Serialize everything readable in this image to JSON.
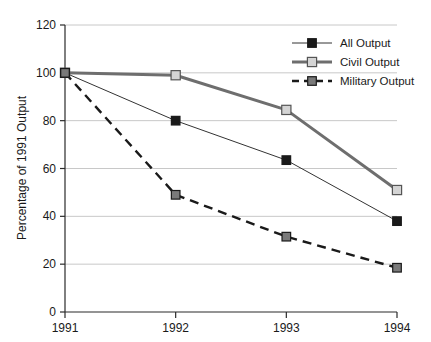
{
  "chart_data": {
    "type": "line",
    "title": "",
    "xlabel": "",
    "ylabel": "Percentage of 1991 Output",
    "categories": [
      "1991",
      "1992",
      "1993",
      "1994"
    ],
    "x": [
      1991,
      1992,
      1993,
      1994
    ],
    "xlim": [
      1991,
      1994
    ],
    "ylim": [
      0,
      120
    ],
    "yticks": [
      0,
      20,
      40,
      60,
      80,
      100,
      120
    ],
    "ytick_labels": [
      "0",
      "20",
      "40",
      "60",
      "80",
      "100",
      "120"
    ],
    "xtick_labels": [
      "1991",
      "1992",
      "1993",
      "1994"
    ],
    "grid": "horizontal",
    "legend_position": "top-right",
    "series": [
      {
        "name": "All Output",
        "values": [
          100,
          80,
          63.5,
          38
        ],
        "color": "#333333",
        "marker": "filled-square",
        "marker_fill": "#1a1a1a",
        "line_style": "solid",
        "line_width": 1
      },
      {
        "name": "Civil Output",
        "values": [
          100,
          99,
          84.5,
          51
        ],
        "color": "#6e6e6e",
        "marker": "open-square",
        "marker_fill": "#d4d4d4",
        "line_style": "solid",
        "line_width": 3
      },
      {
        "name": "Military Output",
        "values": [
          100,
          49,
          31.5,
          18.5
        ],
        "color": "#1a1a1a",
        "marker": "filled-square",
        "marker_fill": "#7a7a7a",
        "line_style": "dashed",
        "line_width": 2.4
      }
    ]
  },
  "legend": {
    "items": [
      {
        "label": "All Output"
      },
      {
        "label": "Civil Output"
      },
      {
        "label": "Military Output"
      }
    ]
  },
  "axes": {
    "y_title": "Percentage of 1991 Output",
    "y_ticks": [
      "120",
      "100",
      "80",
      "60",
      "40",
      "20",
      "0"
    ],
    "x_ticks": [
      "1991",
      "1992",
      "1993",
      "1994"
    ]
  },
  "colors": {
    "grid": "#c8c8c8",
    "axis": "#2b2b2b",
    "background": "#ffffff",
    "all_output": "#1a1a1a",
    "civil_output": "#6e6e6e",
    "military_output": "#7a7a7a"
  }
}
